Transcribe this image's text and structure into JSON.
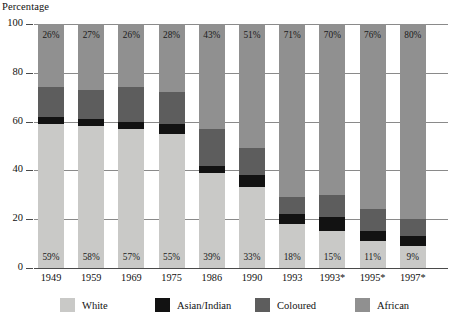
{
  "chart_data": {
    "type": "bar",
    "subtype": "stacked-bar-100",
    "title": "",
    "ylabel": "Percentage",
    "xlabel": "",
    "ylim": [
      0,
      100
    ],
    "yticks": [
      0,
      20,
      40,
      60,
      80,
      100
    ],
    "grid": true,
    "legend_position": "bottom",
    "categories": [
      "1949",
      "1959",
      "1969",
      "1975",
      "1986",
      "1990",
      "1993",
      "1993*",
      "1995*",
      "1997*"
    ],
    "series": [
      {
        "name": "White",
        "color": "#c9c9c7",
        "values": [
          59,
          58,
          57,
          55,
          39,
          33,
          18,
          15,
          11,
          9
        ]
      },
      {
        "name": "Asian/Indian",
        "color": "#121212",
        "values": [
          3,
          3,
          3,
          4,
          3,
          5,
          4,
          6,
          4,
          4
        ]
      },
      {
        "name": "Coloured",
        "color": "#5d5d5d",
        "values": [
          12,
          12,
          14,
          13,
          15,
          11,
          7,
          9,
          9,
          7
        ]
      },
      {
        "name": "African",
        "color": "#909090",
        "values": [
          26,
          27,
          26,
          28,
          43,
          51,
          71,
          70,
          76,
          80
        ]
      }
    ],
    "data_labels": {
      "top_series": "African",
      "bottom_series": "White",
      "top": [
        "26%",
        "27%",
        "26%",
        "28%",
        "43%",
        "51%",
        "71%",
        "70%",
        "76%",
        "80%"
      ],
      "bottom": [
        "59%",
        "58%",
        "57%",
        "55%",
        "39%",
        "33%",
        "18%",
        "15%",
        "11%",
        "9%"
      ]
    }
  },
  "legend": {
    "items": [
      {
        "label": "White",
        "color": "#c9c9c7"
      },
      {
        "label": "Asian/Indian",
        "color": "#121212"
      },
      {
        "label": "Coloured",
        "color": "#5d5d5d"
      },
      {
        "label": "African",
        "color": "#909090"
      }
    ]
  },
  "axis": {
    "y_title": "Percentage",
    "y_ticks": [
      "100",
      "80",
      "60",
      "40",
      "20",
      "0"
    ]
  }
}
